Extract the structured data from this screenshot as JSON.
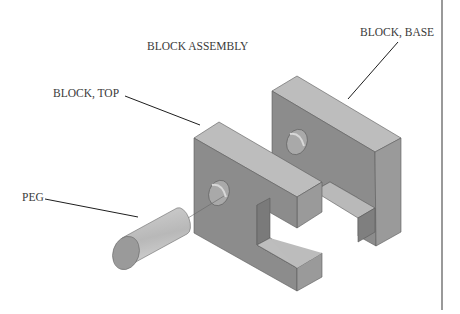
{
  "title": "BLOCK ASSEMBLY",
  "callouts": {
    "base": "BLOCK, BASE",
    "top": "BLOCK, TOP",
    "peg": "PEG"
  },
  "colors": {
    "background": "#ffffff",
    "face_front": "#8e8e8e",
    "face_top": "#bcbcbc",
    "face_side": "#9c9c9c",
    "edge": "#4a4a4a",
    "leader": "#1e1e1e",
    "text": "#3a3a3a",
    "border_line": "#555555"
  }
}
